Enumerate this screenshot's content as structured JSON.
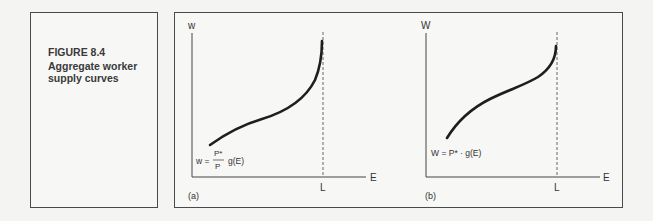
{
  "caption": {
    "figure_number": "FIGURE 8.4",
    "title": "Aggregate worker supply curves"
  },
  "panels": [
    {
      "id": "a",
      "panel_label": "(a)",
      "y_axis_label": "w",
      "x_axis_label": "E",
      "vertical_marker_label": "L",
      "formula_lhs": "w =",
      "formula_num": "P*",
      "formula_den": "P",
      "formula_rhs": "g(E)",
      "curve_shape": "upward S-shaped, becoming vertical at L"
    },
    {
      "id": "b",
      "panel_label": "(b)",
      "y_axis_label": "W",
      "x_axis_label": "E",
      "vertical_marker_label": "L",
      "formula": "W = P* · g(E)",
      "curve_shape": "upward S-shaped, becoming vertical at L"
    }
  ],
  "colors": {
    "curve": "#1e1e1e",
    "axis": "#444444",
    "border": "#4a4a4a",
    "background": "#f7f7f5"
  }
}
